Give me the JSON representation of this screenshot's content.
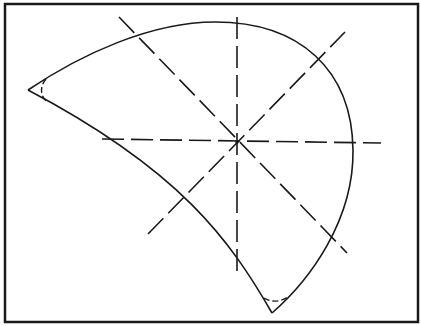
{
  "diagram": {
    "type": "geometric-construction",
    "colors": {
      "background": "#ffffff",
      "stroke": "#1a1a1a"
    },
    "frame": {
      "x": 5,
      "y": 4,
      "width": 413,
      "height": 318
    },
    "center_point": {
      "x": 237,
      "y": 142
    },
    "shape": {
      "cusp_left": {
        "x": 28,
        "y": 90
      },
      "cusp_bottom": {
        "x": 272,
        "y": 313
      },
      "outer_arc_path": "M 28 90 C 80 55, 150 22, 215 22 C 300 22, 352 70, 353 150 C 354 220, 310 280, 272 313",
      "inner_arc_path": "M 272 313 C 230 240, 180 170, 28 90",
      "fillet_left_path": "M 46 79 C 40 86, 40 95, 46 101",
      "fillet_bottom_path": "M 264 298 C 270 302, 280 303, 289 296"
    },
    "construction_lines": [
      {
        "name": "vertical-axis",
        "x1": 237,
        "y1": 17,
        "x2": 237,
        "y2": 276
      },
      {
        "name": "horizontal-axis",
        "x1": 102,
        "y1": 139,
        "x2": 381,
        "y2": 143
      },
      {
        "name": "diagonal-descending",
        "x1": 119,
        "y1": 17,
        "x2": 347,
        "y2": 253
      },
      {
        "name": "diagonal-ascending",
        "x1": 148,
        "y1": 234,
        "x2": 345,
        "y2": 32
      }
    ]
  }
}
